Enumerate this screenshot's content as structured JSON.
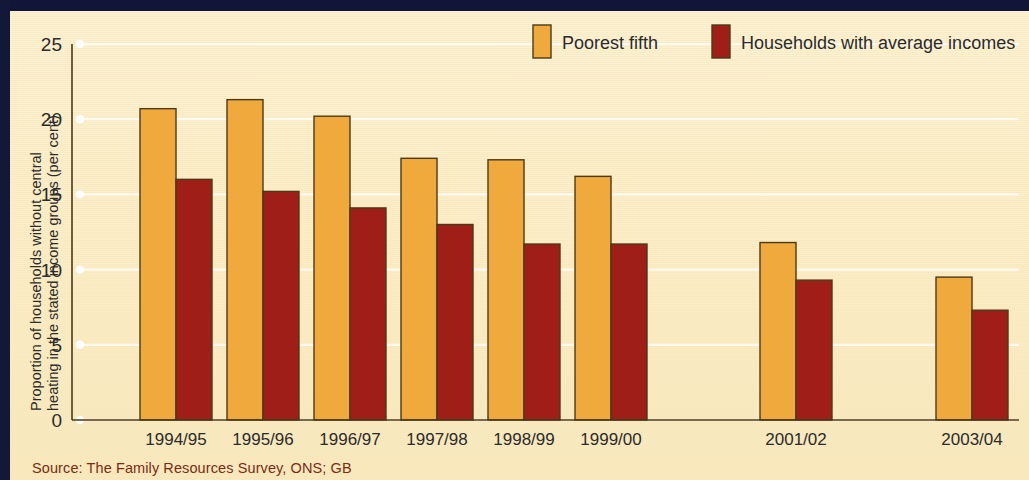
{
  "source_note": "Source: The Family Resources Survey, ONS; GB",
  "colors": {
    "poorest_fifth": "#F0A93C",
    "average_incomes": "#A01E18",
    "background": "#FBEEC9",
    "border_navy": "#111538",
    "bar_outline": "#4A3A18",
    "source_text": "#7A2C12",
    "gridline": "#FFFFFF"
  },
  "chart_data": {
    "type": "bar",
    "title": "",
    "xlabel": "",
    "ylabel_line1": "Proportion of households without central",
    "ylabel_line2": "heating in the stated income groups (per cent)",
    "ylim": [
      0,
      25
    ],
    "yticks": [
      0,
      5,
      10,
      15,
      20,
      25
    ],
    "ytick_labels": [
      "0",
      "5",
      "10",
      "15",
      "20",
      "25"
    ],
    "grid": true,
    "legend_position": "top-right",
    "categories": [
      "1994/95",
      "1995/96",
      "1996/97",
      "1997/98",
      "1998/99",
      "1999/00",
      "2000/01",
      "2001/02",
      "2002/03",
      "2003/04"
    ],
    "missing_categories": [
      "2000/01",
      "2002/03"
    ],
    "visible_categories": [
      "1994/95",
      "1995/96",
      "1996/97",
      "1997/98",
      "1998/99",
      "1999/00",
      "2001/02",
      "2003/04"
    ],
    "series": [
      {
        "name": "Poorest fifth",
        "color": "#F0A93C",
        "values": [
          20.7,
          21.3,
          20.2,
          17.4,
          17.3,
          16.2,
          null,
          11.8,
          null,
          9.5
        ]
      },
      {
        "name": "Households with average incomes",
        "color": "#A01E18",
        "values": [
          16.0,
          15.2,
          14.1,
          13.0,
          11.7,
          11.7,
          null,
          9.3,
          null,
          7.3
        ]
      }
    ]
  },
  "legend": {
    "items": [
      {
        "label": "Poorest fifth",
        "color": "#F0A93C"
      },
      {
        "label": "Households with average incomes",
        "color": "#A01E18"
      }
    ]
  }
}
